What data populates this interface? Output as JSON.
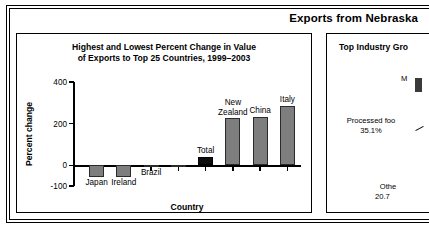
{
  "header": {
    "title": "Exports from Nebraska"
  },
  "left_panel": {
    "name": "bar-chart-panel",
    "title_line1": "Highest and Lowest Percent Change in Value",
    "title_line2": "of Exports to Top 25 Countries, 1999–2003"
  },
  "right_panel": {
    "name": "pie-chart-panel",
    "title": "Top Industry Gro",
    "labels": [
      {
        "text": "M",
        "value": ""
      },
      {
        "text": "Processed foo",
        "value": "35.1%"
      },
      {
        "text": "Othe",
        "value": "20.7"
      }
    ]
  },
  "chart_data": {
    "type": "bar",
    "title": "Highest and Lowest Percent Change in Value of Exports to Top 25 Countries, 1999–2003",
    "xlabel": "Country",
    "ylabel": "Percent change",
    "ylim": [
      -100,
      400
    ],
    "yticks": [
      400,
      200,
      0,
      -100
    ],
    "ytick_labels": [
      "400",
      "200",
      "0",
      "-100"
    ],
    "grid": false,
    "legend": "none",
    "categories": [
      "Japan",
      "Ireland",
      "Brazil",
      "",
      "Total",
      "New Zealand",
      "China",
      "Italy"
    ],
    "values": [
      -58,
      -55,
      -10,
      -4,
      40,
      225,
      232,
      287
    ],
    "series": [
      {
        "name": "Percent change",
        "values": [
          -58,
          -55,
          -10,
          -4,
          40,
          225,
          232,
          287
        ]
      }
    ],
    "bar_colors": [
      "#7e7e7e",
      "#7e7e7e",
      "#7e7e7e",
      "#7e7e7e",
      "#0d0d0d",
      "#7e7e7e",
      "#7e7e7e",
      "#7e7e7e"
    ],
    "highlight_category": "Total",
    "highlight_color": "#0d0d0d"
  },
  "colors": {
    "bar_fill": "#7e7e7e",
    "bar_edge": "#2b2b2b",
    "total_fill": "#0d0d0d",
    "frame": "#000000",
    "background": "#ffffff"
  }
}
